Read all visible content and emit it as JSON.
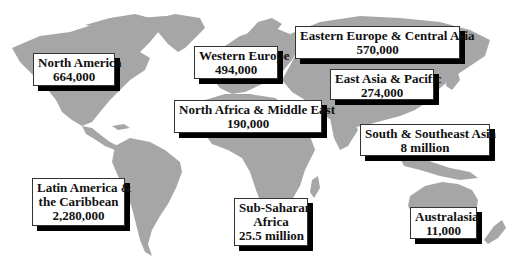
{
  "map": {
    "type": "world-region-map",
    "colors": {
      "land": "#a6a6a6",
      "background": "#ffffff",
      "shadow": "#000000",
      "box": "#ffffff"
    }
  },
  "regions": [
    {
      "id": "north-america",
      "name": "North America",
      "lines": [
        "North America",
        "664,000"
      ],
      "value": "664,000"
    },
    {
      "id": "western-europe",
      "name": "Western Europe",
      "lines": [
        "Western Europe",
        "494,000"
      ],
      "value": "494,000"
    },
    {
      "id": "eastern-europe-central-asia",
      "name": "Eastern Europe & Central Asia",
      "lines": [
        "Eastern Europe & Central Asia",
        "570,000"
      ],
      "value": "570,000"
    },
    {
      "id": "east-asia-pacific",
      "name": "East Asia & Pacific",
      "lines": [
        "East Asia & Pacific",
        "274,000"
      ],
      "value": "274,000"
    },
    {
      "id": "north-africa-middle-east",
      "name": "North Africa & Middle East",
      "lines": [
        "North Africa & Middle East",
        "190,000"
      ],
      "value": "190,000"
    },
    {
      "id": "south-southeast-asia",
      "name": "South & Southeast Asia",
      "lines": [
        "South & Southeast Asia",
        "8 million"
      ],
      "value": "8 million"
    },
    {
      "id": "latin-america-caribbean",
      "name": "Latin America & the Caribbean",
      "lines": [
        "Latin America &",
        "the Caribbean",
        "2,280,000"
      ],
      "value": "2,280,000"
    },
    {
      "id": "sub-saharan-africa",
      "name": "Sub-Saharan Africa",
      "lines": [
        "Sub-Saharan",
        "Africa",
        "25.5 million"
      ],
      "value": "25.5 million"
    },
    {
      "id": "australasia",
      "name": "Australasia",
      "lines": [
        "Australasia",
        "11,000"
      ],
      "value": "11,000"
    }
  ]
}
